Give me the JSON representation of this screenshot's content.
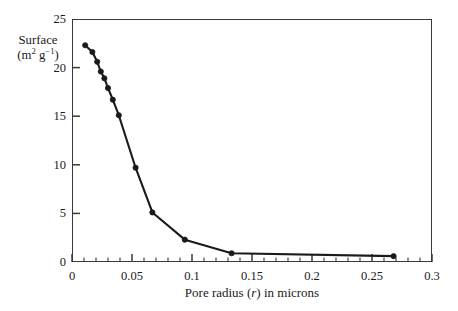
{
  "chart_data": {
    "type": "line",
    "title": "",
    "xlabel": "Pore radius (r) in microns",
    "ylabel_line1": "Surface",
    "ylabel_units_base": "(m",
    "ylabel_units_sup1": "2",
    "ylabel_units_mid": " g",
    "ylabel_units_sup2": "−1",
    "ylabel_units_close": ")",
    "xlim": [
      0,
      0.3
    ],
    "ylim": [
      0,
      25
    ],
    "xticks": [
      0,
      0.05,
      0.1,
      0.15,
      0.2,
      0.25,
      0.3
    ],
    "xtick_labels": [
      "0",
      "0.05",
      "0.1",
      "0.15",
      "0.2",
      "0.25",
      "0.3"
    ],
    "x_minor_step": 0.01,
    "yticks": [
      0,
      5,
      10,
      15,
      20,
      25
    ],
    "ytick_labels": [
      "0",
      "5",
      "10",
      "15",
      "20",
      "25"
    ],
    "grid": false,
    "legend": "none",
    "marker": "filled-circle",
    "line_color": "#1a1a1a",
    "marker_color": "#1a1a1a",
    "x": [
      0.011,
      0.017,
      0.021,
      0.024,
      0.027,
      0.03,
      0.034,
      0.039,
      0.053,
      0.067,
      0.094,
      0.133,
      0.268
    ],
    "y": [
      22.3,
      21.6,
      20.6,
      19.6,
      18.9,
      17.9,
      16.7,
      15.1,
      9.7,
      5.1,
      2.3,
      0.9,
      0.6
    ],
    "series": [
      {
        "name": "Surface area vs pore radius",
        "points": [
          {
            "x": 0.011,
            "y": 22.3
          },
          {
            "x": 0.017,
            "y": 21.6
          },
          {
            "x": 0.021,
            "y": 20.6
          },
          {
            "x": 0.024,
            "y": 19.6
          },
          {
            "x": 0.027,
            "y": 18.9
          },
          {
            "x": 0.03,
            "y": 17.9
          },
          {
            "x": 0.034,
            "y": 16.7
          },
          {
            "x": 0.039,
            "y": 15.1
          },
          {
            "x": 0.053,
            "y": 9.7
          },
          {
            "x": 0.067,
            "y": 5.1
          },
          {
            "x": 0.094,
            "y": 2.3
          },
          {
            "x": 0.133,
            "y": 0.9
          },
          {
            "x": 0.268,
            "y": 0.6
          }
        ]
      }
    ]
  }
}
